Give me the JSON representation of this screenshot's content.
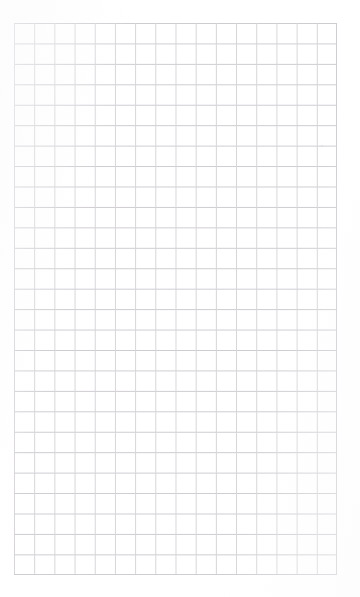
{
  "document": {
    "kind": "grid-paper-scan",
    "description": "Blank scanned sheet of square-ruled graph paper",
    "page_background": "#ffffff",
    "has_text": false,
    "has_handwriting": false,
    "alt_text": "A blank sheet of square grid / graph paper with faint gray ruling lines"
  },
  "grid": {
    "columns": 16,
    "rows": 27,
    "cell_width_px": 20.2,
    "cell_height_px": 20.45,
    "left_px": 14,
    "top_px": 23,
    "right_px": 337,
    "bottom_px": 575,
    "width_px": 323,
    "height_px": 552,
    "line_color": "#d2d0d4",
    "line_color_horizontal": "#cdcbd0",
    "line_color_vertical": "#d6d4d8",
    "line_width_px": 1,
    "border_color": "#cfcdd2"
  },
  "margins": {
    "top_px": 23,
    "left_px": 14,
    "right_px": 23,
    "bottom_px": 22,
    "color": "#ffffff"
  },
  "artifacts": [
    {
      "name": "scan-speck",
      "left_px": 321,
      "top_px": 145,
      "size_px": 2,
      "color": "#dcdade"
    }
  ]
}
